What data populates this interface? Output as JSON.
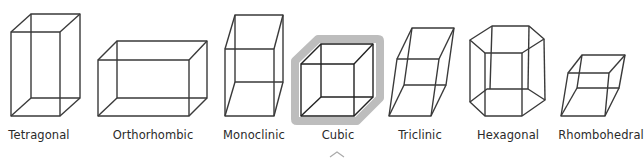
{
  "lattices": [
    {
      "id": "tetragonal",
      "label": "Tetragonal",
      "center_x": 39
    },
    {
      "id": "orthorhombic",
      "label": "Orthorhombic",
      "center_x": 153
    },
    {
      "id": "monoclinic",
      "label": "Monoclinic",
      "center_x": 254
    },
    {
      "id": "cubic",
      "label": "Cubic",
      "center_x": 338,
      "selected": true
    },
    {
      "id": "triclinic",
      "label": "Triclinic",
      "center_x": 420
    },
    {
      "id": "hexagonal",
      "label": "Hexagonal",
      "center_x": 508
    },
    {
      "id": "rhombohedral",
      "label": "Rhombohedral",
      "center_x": 601
    }
  ],
  "colors": {
    "line": "#3a3a3a",
    "highlight": "#bdbdbd",
    "text": "#2a2a2a",
    "background": "#ffffff"
  },
  "selection_indicator": "caret-up"
}
